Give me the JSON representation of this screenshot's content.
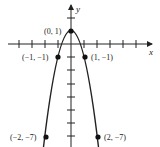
{
  "figure": {
    "function": "y = 1 - 2x^2",
    "axes": {
      "x_label": "x",
      "y_label": "y"
    },
    "points": [
      {
        "label": "(0, 1)",
        "x": 0,
        "y": 1
      },
      {
        "label": "(−1, −1)",
        "x": -1,
        "y": -1
      },
      {
        "label": "(1, −1)",
        "x": 1,
        "y": -1
      },
      {
        "label": "(−2, −7)",
        "x": -2,
        "y": -7
      },
      {
        "label": "(2, −7)",
        "x": 2,
        "y": -7
      }
    ],
    "colors": {
      "stroke": "#222222",
      "background": "#ffffff"
    }
  }
}
